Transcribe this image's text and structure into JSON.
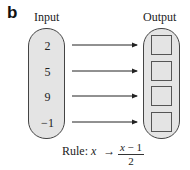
{
  "panel_label": "b",
  "input": {
    "title": "Input",
    "values": [
      "2",
      "5",
      "9",
      "−1"
    ]
  },
  "output": {
    "title": "Output",
    "boxes": [
      "",
      "",
      "",
      ""
    ]
  },
  "arrows": 4,
  "rule": {
    "label": "Rule:",
    "variable": "x",
    "arrow": "→",
    "numerator_var": "x",
    "numerator_rest": " − 1",
    "denominator": "2"
  },
  "colors": {
    "capsule_fill": "#e4e4e4",
    "stroke": "#444444"
  }
}
